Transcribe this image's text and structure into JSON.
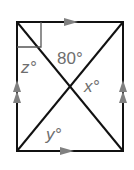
{
  "diagram": {
    "type": "rectangle-with-diagonals",
    "labels": {
      "top_angle": "80°",
      "z": "z°",
      "x": "x°",
      "y": "y°"
    },
    "markings": {
      "top_bottom_parallel": "single-arrow",
      "left_right_parallel": "double-arrow",
      "right_angle_corner": "top-left"
    },
    "colors": {
      "line": "#111111",
      "label": "#6e6e6e",
      "arrow": "#808080"
    }
  }
}
